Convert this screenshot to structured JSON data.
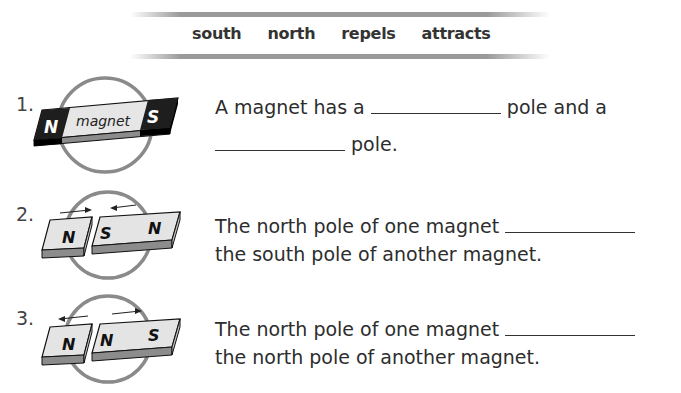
{
  "word_bank": {
    "words": [
      "south",
      "north",
      "repels",
      "attracts"
    ]
  },
  "questions": [
    {
      "number": "1.",
      "image": {
        "magnet_label": "magnet",
        "left_pole": "N",
        "right_pole": "S"
      },
      "line1_before": "A magnet has a",
      "line1_after": "pole and a",
      "line2_after": "pole."
    },
    {
      "number": "2.",
      "image": {
        "left_magnet_pole": "N",
        "right_magnet_near_pole": "S",
        "right_magnet_far_pole": "N"
      },
      "line1": "The north pole of one magnet",
      "line2": "the south pole of another magnet."
    },
    {
      "number": "3.",
      "image": {
        "left_magnet_pole": "N",
        "right_magnet_near_pole": "N",
        "right_magnet_far_pole": "S"
      },
      "line1": "The north pole of one magnet",
      "line2": "the north pole of another magnet."
    }
  ],
  "colors": {
    "circle": "#8a8a8a",
    "magnet_face": "#e4e4e4",
    "magnet_side": "#9a9a9a",
    "magnet_dark": "#1e1e1e"
  }
}
